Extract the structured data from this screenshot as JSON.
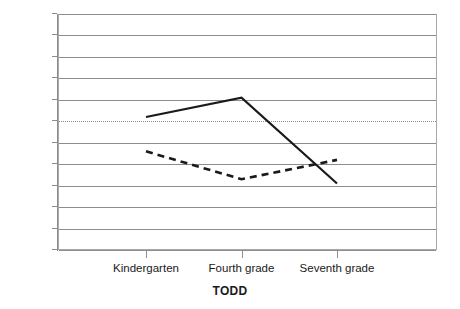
{
  "chart_data": {
    "type": "line",
    "title": "",
    "xlabel": "TODD",
    "ylabel": "",
    "categories": [
      "Kindergarten",
      "Fourth grade",
      "Seventh grade"
    ],
    "ylim": [
      -3.0,
      2.5
    ],
    "yticks": [
      2.5,
      2.0,
      1.5,
      1.0,
      0.5,
      0,
      -0.5,
      -1.0,
      -1.5,
      -2.0,
      -2.5,
      -3.0
    ],
    "ytick_labels": [
      "2.5",
      "2.0",
      "1.5",
      "1.0",
      "0.5",
      "0",
      "−0.5",
      "−1.0",
      "−1.5",
      "−2.0",
      "−2.5",
      "−3.0"
    ],
    "grid": true,
    "zero_line": true,
    "legend": "none",
    "series": [
      {
        "name": "solid-series",
        "style": "solid",
        "color": "#1a1a1a",
        "values": [
          0.1,
          0.55,
          -1.45
        ]
      },
      {
        "name": "dashed-series",
        "style": "dashed",
        "color": "#1a1a1a",
        "values": [
          -0.7,
          -1.35,
          -0.9
        ]
      }
    ]
  }
}
